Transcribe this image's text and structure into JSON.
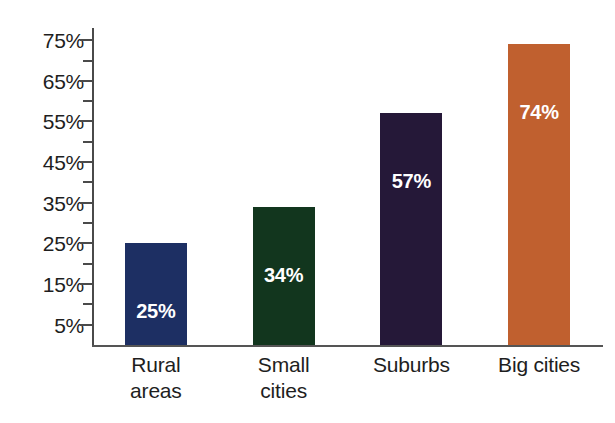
{
  "chart_data": {
    "type": "bar",
    "title": "",
    "subtitle": "",
    "xlabel": "",
    "ylabel": "",
    "categories": [
      "Rural areas",
      "Small cities",
      "Suburbs",
      "Big cities"
    ],
    "category_lines": [
      [
        "Rural",
        "areas"
      ],
      [
        "Small",
        "cities"
      ],
      [
        "Suburbs"
      ],
      [
        "Big cities"
      ]
    ],
    "values": [
      25,
      34,
      57,
      74
    ],
    "value_labels": [
      "25%",
      "34%",
      "57%",
      "74%"
    ],
    "bar_colors": [
      "#1d2f63",
      "#12361e",
      "#251838",
      "#c0602f"
    ],
    "ylim": [
      0,
      78
    ],
    "y_tick_labels": [
      "75%",
      "65%",
      "55%",
      "45%",
      "35%",
      "25%",
      "15%",
      "5%"
    ],
    "y_tick_values": [
      75,
      65,
      55,
      45,
      35,
      25,
      15,
      5
    ],
    "y_minor_tick_values": [
      70,
      60,
      50,
      40,
      30,
      20,
      10
    ],
    "grid": false,
    "legend": "none",
    "value_label_color": "#ffffff",
    "axis_color": "#4a4a4a",
    "background_color": "#ffffff"
  },
  "bars": [
    {
      "category": "Rural areas",
      "value": 25,
      "label": "25%",
      "color": "#1d2f63"
    },
    {
      "category": "Small cities",
      "value": 34,
      "label": "34%",
      "color": "#12361e"
    },
    {
      "category": "Suburbs",
      "value": 57,
      "label": "57%",
      "color": "#251838"
    },
    {
      "category": "Big cities",
      "value": 74,
      "label": "74%",
      "color": "#c0602f"
    }
  ]
}
